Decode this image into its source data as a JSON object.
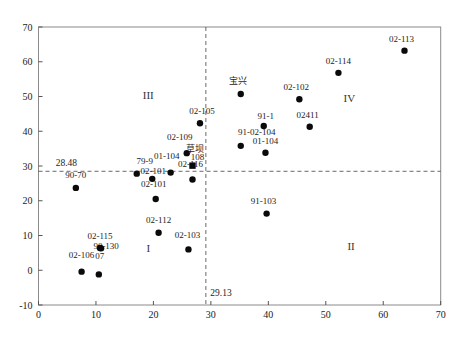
{
  "figure": {
    "background": "#ffffff",
    "frame_color": "#8a8a8a",
    "tick_color": "#555555",
    "point_color": "#0a0a0a",
    "text_color": "#1c1c1c",
    "ref_line_color": "#444444"
  },
  "chart_data": {
    "type": "scatter",
    "title": "",
    "xlabel": "",
    "ylabel": "",
    "xlim": [
      0,
      70
    ],
    "ylim": [
      -10,
      70
    ],
    "xticks": [
      0,
      10,
      20,
      30,
      40,
      50,
      60,
      70
    ],
    "yticks": [
      -10,
      0,
      10,
      20,
      30,
      40,
      50,
      60,
      70
    ],
    "grid": false,
    "legend": "none",
    "reference_lines": {
      "horizontal": {
        "value": 28.48,
        "label": "28.48",
        "label_x": 3.0,
        "label_y": 30.0
      },
      "vertical": {
        "value": 29.13,
        "label": "29.13",
        "label_x": 29.9,
        "label_y": -7.4
      }
    },
    "quadrant_labels": [
      {
        "numeral": "I",
        "x": 19.1,
        "y": 6.5
      },
      {
        "numeral": "II",
        "x": 54.4,
        "y": 7.0
      },
      {
        "numeral": "III",
        "x": 19.1,
        "y": 50.4
      },
      {
        "numeral": "IV",
        "x": 54.1,
        "y": 49.5
      }
    ],
    "annotations": [
      {
        "text": "草坝",
        "x": 27.2,
        "y": 34.9
      }
    ],
    "points": [
      {
        "label": "02-113",
        "x": 63.7,
        "y": 63.2,
        "marker": "circle",
        "dx": -3,
        "dy": -9
      },
      {
        "label": "02-114",
        "x": 52.2,
        "y": 56.8,
        "marker": "circle",
        "dx": 0,
        "dy": -9
      },
      {
        "label": "宝兴",
        "x": 35.2,
        "y": 50.7,
        "marker": "circle",
        "dx": -3,
        "dy": -10
      },
      {
        "label": "02-102",
        "x": 45.4,
        "y": 49.2,
        "marker": "circle",
        "dx": -3,
        "dy": -9
      },
      {
        "label": "02411",
        "x": 47.2,
        "y": 41.3,
        "marker": "circle",
        "dx": -2,
        "dy": -9
      },
      {
        "label": "91-1",
        "x": 39.2,
        "y": 41.5,
        "marker": "circle",
        "dx": 2,
        "dy": -7
      },
      {
        "label": "91-02-104",
        "x": 35.2,
        "y": 35.8,
        "marker": "circle",
        "dx": 16,
        "dy": -11
      },
      {
        "label": "01-104",
        "x": 39.5,
        "y": 33.8,
        "marker": "circle",
        "dx": 0,
        "dy": -9
      },
      {
        "label": "02-105",
        "x": 28.1,
        "y": 42.3,
        "marker": "circle",
        "dx": 2,
        "dy": -9
      },
      {
        "label": "02-109",
        "x": 25.8,
        "y": 33.7,
        "marker": "circle",
        "dx": -7,
        "dy": -13
      },
      {
        "label": "79-9",
        "x": 17.1,
        "y": 27.8,
        "marker": "circle",
        "dx": 8,
        "dy": -10
      },
      {
        "label": "02-101",
        "x": 19.8,
        "y": 26.3,
        "marker": "circle",
        "dx": 1,
        "dy": -5
      },
      {
        "label": "01-104",
        "x": 23.0,
        "y": 28.1,
        "marker": "circle",
        "dx": -4,
        "dy": -14
      },
      {
        "label": "108",
        "x": 26.8,
        "y": 30.1,
        "marker": "square",
        "dx": 5,
        "dy": -6
      },
      {
        "label": "02-116",
        "x": 26.8,
        "y": 26.1,
        "marker": "circle",
        "dx": -2,
        "dy": -13
      },
      {
        "label": "02-101",
        "x": 20.4,
        "y": 20.5,
        "marker": "circle",
        "dx": -2,
        "dy": -12
      },
      {
        "label": "90-70",
        "x": 6.5,
        "y": 23.7,
        "marker": "circle",
        "dx": 0,
        "dy": -10
      },
      {
        "label": "02-112",
        "x": 20.9,
        "y": 10.8,
        "marker": "circle",
        "dx": 0,
        "dy": -10
      },
      {
        "label": "02-103",
        "x": 26.1,
        "y": 6.0,
        "marker": "circle",
        "dx": -1,
        "dy": -11
      },
      {
        "label": "91-103",
        "x": 39.7,
        "y": 16.3,
        "marker": "circle",
        "dx": -3,
        "dy": -10
      },
      {
        "label": "02-115",
        "x": 10.7,
        "y": 6.4,
        "marker": "circle",
        "dx": 0,
        "dy": -9
      },
      {
        "label": "90-130",
        "x": 10.9,
        "y": 6.3,
        "marker": "circle",
        "dx": 5,
        "dy": 1
      },
      {
        "label": "02-106",
        "x": 7.5,
        "y": -0.4,
        "marker": "circle",
        "dx": 0,
        "dy": -14
      },
      {
        "label": "07",
        "x": 10.5,
        "y": -1.2,
        "marker": "circle",
        "dx": 1,
        "dy": -15
      }
    ],
    "plot_area_px": {
      "left": 38.5,
      "right": 440.7,
      "top": 27,
      "bottom": 305
    }
  }
}
